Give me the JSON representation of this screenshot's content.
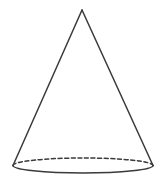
{
  "figure": {
    "name": "cone",
    "canvas": {
      "width": 165,
      "height": 192,
      "background_color": "#ffffff"
    },
    "style": {
      "stroke_color": "#3a3a3a",
      "stroke_width": 1.5,
      "fill": "none",
      "dash_pattern": "4 2.6",
      "line_cap": "round",
      "line_join": "round"
    },
    "geometry": {
      "apex": {
        "x": 82,
        "y": 10
      },
      "base_center": {
        "x": 83,
        "y": 165
      },
      "base_semi_major_axis": 70,
      "base_semi_minor_axis": 7.5,
      "left_base_vertex": {
        "x": 13,
        "y": 165.5
      },
      "right_base_vertex": {
        "x": 153,
        "y": 165.5
      },
      "height_px": 155,
      "base_width_px": 140
    },
    "parts": [
      {
        "id": "apex-point",
        "label": "Apex",
        "visible": true
      },
      {
        "id": "left-slant-edge",
        "label": "Left slant edge",
        "from": {
          "x": 82,
          "y": 10
        },
        "to": {
          "x": 13,
          "y": 165.5
        },
        "stroke": "solid",
        "visible": true
      },
      {
        "id": "right-slant-edge",
        "label": "Right slant edge",
        "from": {
          "x": 82,
          "y": 10
        },
        "to": {
          "x": 153,
          "y": 165.5
        },
        "stroke": "solid",
        "visible": true
      },
      {
        "id": "base-front-arc",
        "label": "Base front arc",
        "stroke": "solid",
        "visible": true,
        "path": "M 13 165.5 A 70 7.5 0 0 0 153 165.5"
      },
      {
        "id": "base-back-arc",
        "label": "Base hidden back arc",
        "stroke": "dashed",
        "visible": true,
        "path": "M 13 165.5 A 70 7.5 0 0 1 153 165.5"
      }
    ],
    "paths": {
      "left_slant": "M 82 10 L 13 165.5",
      "right_slant": "M 82 10 L 153 165.5",
      "front_arc": "M 13 165.5 A 70 7.5 0 0 0 153 165.5",
      "back_arc_dashed": "M 13 165.5 A 70 7.5 0 0 1 153 165.5"
    },
    "labels": [],
    "annotations": []
  }
}
